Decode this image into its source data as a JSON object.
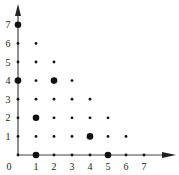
{
  "chart_data": {
    "type": "scatter",
    "title": "",
    "xlabel": "",
    "ylabel": "",
    "xlim": [
      0,
      7
    ],
    "ylim": [
      0,
      7
    ],
    "grid": false,
    "legend": null,
    "x_ticks": [
      "0",
      "1",
      "2",
      "3",
      "4",
      "5",
      "6",
      "7"
    ],
    "y_ticks": [
      "1",
      "2",
      "3",
      "4",
      "5",
      "6",
      "7"
    ],
    "small_points": [
      [
        0,
        6
      ],
      [
        1,
        6
      ],
      [
        0,
        5
      ],
      [
        1,
        5
      ],
      [
        2,
        5
      ],
      [
        1,
        4
      ],
      [
        3,
        4
      ],
      [
        0,
        3
      ],
      [
        1,
        3
      ],
      [
        2,
        3
      ],
      [
        3,
        3
      ],
      [
        4,
        3
      ],
      [
        0,
        2
      ],
      [
        2,
        2
      ],
      [
        3,
        2
      ],
      [
        4,
        2
      ],
      [
        5,
        2
      ],
      [
        0,
        1
      ],
      [
        1,
        1
      ],
      [
        2,
        1
      ],
      [
        3,
        1
      ],
      [
        5,
        1
      ],
      [
        6,
        1
      ],
      [
        0,
        0
      ],
      [
        2,
        0
      ],
      [
        3,
        0
      ],
      [
        4,
        0
      ],
      [
        6,
        0
      ],
      [
        7,
        0
      ]
    ],
    "large_points": [
      [
        0,
        7
      ],
      [
        0,
        4
      ],
      [
        2,
        4
      ],
      [
        1,
        2
      ],
      [
        4,
        1
      ],
      [
        1,
        0
      ],
      [
        5,
        0
      ]
    ],
    "colors": {
      "points": "#111111",
      "axes": "#444444"
    }
  }
}
